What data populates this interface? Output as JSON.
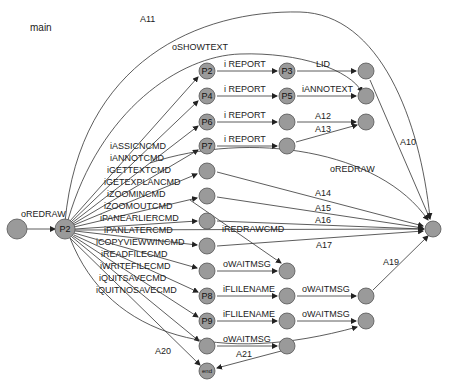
{
  "title": "main",
  "nodes": {
    "start": {
      "label": ""
    },
    "p2main": {
      "label": "P2"
    },
    "c1_0": {
      "label": "P2"
    },
    "c1_1": {
      "label": "P4"
    },
    "c1_2": {
      "label": "P6"
    },
    "c1_3": {
      "label": "P7"
    },
    "c1_9": {
      "label": "P8"
    },
    "c1_10": {
      "label": "P9"
    },
    "c1_12": {
      "label": "end"
    },
    "c2_0": {
      "label": "P3"
    },
    "c2_1": {
      "label": "P5"
    }
  },
  "edge_labels": {
    "start_to_p2": "oREDRAW",
    "a11": "A11",
    "oshowtext": "oSHOWTEXT",
    "fan": [
      "iASSICNCMD",
      "iANNOTCMD",
      "iGETTEXTCMD",
      "iGETEXPLANCMD",
      "iZOOMINCMD",
      "iZOOMOUTCMD",
      "iPANEARLIERCMD",
      "iPANLATERCMD",
      "iCOPYVIEWWINCMD",
      "iREADFILECMD",
      "iWRITEFILECMD",
      "iQUITSAVECMD",
      "iQUITNOSAVECMD"
    ],
    "row0_a": "i REPORT",
    "row0_b": "LID",
    "row1_a": "i REPORT",
    "row1_b": "iANNOTEXT",
    "row2_a": "i REPORT",
    "row2_b": "A12",
    "row3_a": "i REPORT",
    "row3_b": "A13",
    "a10": "A10",
    "oredraw2": "oREDRAW",
    "a14": "A14",
    "a15": "A15",
    "a16": "A16",
    "iredrawcmd": "iREDRAWCMD",
    "a17": "A17",
    "row8_a": "oWAITMSG",
    "row9_a": "iFLILENAME",
    "row9_b": "oWAITMSG",
    "row10_a": "iFLILENAME",
    "row10_b": "oWAITMSG",
    "row11_a": "oWAITMSG",
    "a19": "A19",
    "a20": "A20",
    "a21": "A21"
  }
}
